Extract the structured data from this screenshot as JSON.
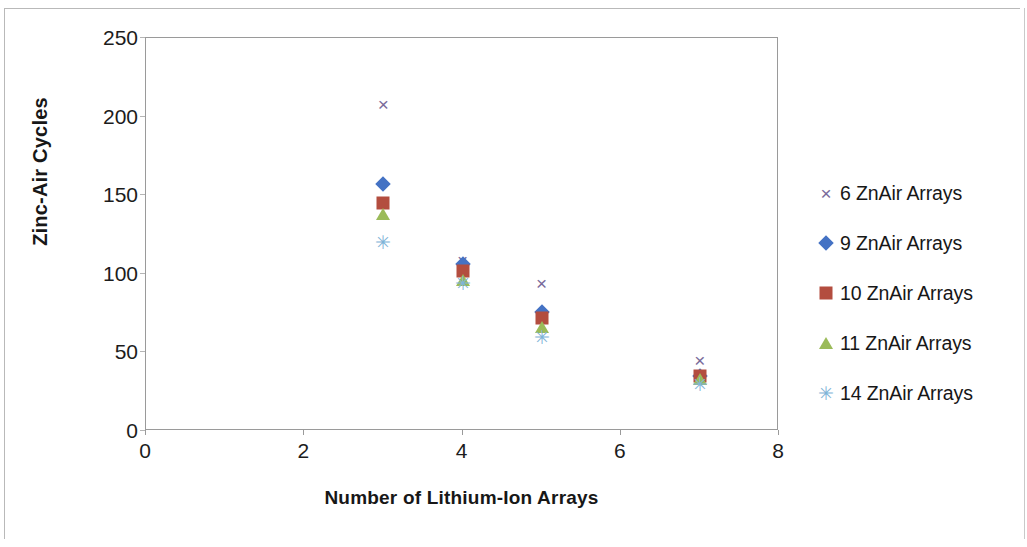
{
  "chart_data": {
    "type": "scatter",
    "title": "",
    "xlabel": "Number of Lithium-Ion Arrays",
    "ylabel": "Zinc-Air Cycles",
    "xlim": [
      0,
      8
    ],
    "ylim": [
      0,
      250
    ],
    "xticks": [
      0,
      2,
      4,
      6,
      8
    ],
    "yticks": [
      0,
      50,
      100,
      150,
      200,
      250
    ],
    "grid": false,
    "legend_position": "right",
    "x": [
      3,
      4,
      5,
      7
    ],
    "series": [
      {
        "name": "6 ZnAir Arrays",
        "marker": "cross",
        "color": "#7A6B9B",
        "values": [
          208,
          109,
          94,
          45
        ]
      },
      {
        "name": "9 ZnAir Arrays",
        "marker": "diamond",
        "color": "#4472C4",
        "values": [
          157,
          106,
          76,
          35
        ]
      },
      {
        "name": "10 ZnAir Arrays",
        "marker": "square",
        "color": "#B34D3F",
        "values": [
          145,
          102,
          72,
          35
        ]
      },
      {
        "name": "11 ZnAir Arrays",
        "marker": "triangle",
        "color": "#9BBB59",
        "values": [
          138,
          96,
          66,
          33
        ]
      },
      {
        "name": "14 ZnAir Arrays",
        "marker": "star",
        "color": "#7FB4D8",
        "values": [
          120,
          94,
          60,
          30
        ]
      }
    ]
  },
  "axis": {
    "y_tick_labels": [
      "0",
      "50",
      "100",
      "150",
      "200",
      "250"
    ],
    "x_tick_labels": [
      "0",
      "2",
      "4",
      "6",
      "8"
    ],
    "y_title": "Zinc-Air Cycles",
    "x_title": "Number of Lithium-Ion Arrays"
  },
  "legend": {
    "items": [
      {
        "label": "6 ZnAir Arrays",
        "marker": "cross-marker-icon",
        "glyph": "×"
      },
      {
        "label": "9 ZnAir Arrays",
        "marker": "diamond-marker-icon",
        "glyph": ""
      },
      {
        "label": "10 ZnAir Arrays",
        "marker": "square-marker-icon",
        "glyph": ""
      },
      {
        "label": "11 ZnAir Arrays",
        "marker": "triangle-marker-icon",
        "glyph": ""
      },
      {
        "label": "14 ZnAir Arrays",
        "marker": "star-marker-icon",
        "glyph": "✳"
      }
    ]
  },
  "glyphs": {
    "cross": "×",
    "star": "✳"
  }
}
